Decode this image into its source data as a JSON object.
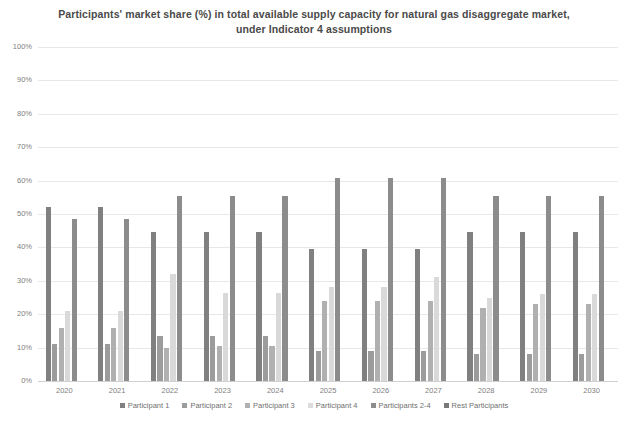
{
  "chart_data": {
    "type": "bar",
    "title": "Participants' market share (%) in total available supply capacity for natural gas disaggregate market, under Indicator 4 assumptions",
    "title_line1": "Participants' market share (%) in total available supply capacity for natural gas disaggregate market,",
    "title_line2": "under Indicator 4 assumptions",
    "xlabel": "",
    "ylabel": "",
    "ylim": [
      0,
      100
    ],
    "ytick_labels": [
      "100%",
      "90%",
      "80%",
      "70%",
      "60%",
      "50%",
      "40%",
      "30%",
      "20%",
      "10%",
      "0%"
    ],
    "ytick_values": [
      100,
      90,
      80,
      70,
      60,
      50,
      40,
      30,
      20,
      10,
      0
    ],
    "grid": true,
    "legend_position": "bottom",
    "categories": [
      "2020",
      "2021",
      "2022",
      "2023",
      "2024",
      "2025",
      "2026",
      "2027",
      "2028",
      "2029",
      "2030"
    ],
    "series": [
      {
        "name": "Participant 1",
        "color": "#808080",
        "values": [
          52,
          52,
          44.5,
          44.5,
          44.5,
          39.5,
          39.5,
          39.5,
          44.5,
          44.5,
          44.5
        ]
      },
      {
        "name": "Participant 2",
        "color": "#9c9c9c",
        "values": [
          11,
          11,
          13.5,
          13.5,
          13.5,
          9,
          9,
          9,
          8,
          8,
          8
        ]
      },
      {
        "name": "Participant 3",
        "color": "#b0b0b0",
        "values": [
          16,
          16,
          10,
          10.5,
          10.5,
          24,
          24,
          24,
          22,
          23,
          23
        ]
      },
      {
        "name": "Participant 4",
        "color": "#d9d9d9",
        "values": [
          21,
          21,
          32,
          26.5,
          26.5,
          28,
          28,
          31,
          25,
          26,
          26
        ]
      },
      {
        "name": "Participants 2-4",
        "color": "#8c8c8c",
        "values": [
          48.5,
          48.5,
          55.5,
          55.5,
          55.5,
          60.8,
          60.8,
          60.8,
          55.5,
          55.5,
          55.5
        ]
      },
      {
        "name": "Rest Participants",
        "color": "#787878",
        "values": [
          0,
          0,
          0,
          0,
          0,
          0,
          0,
          0,
          0,
          0,
          0
        ]
      }
    ]
  },
  "legend": {
    "items": [
      {
        "label": "Participant 1",
        "color": "#808080"
      },
      {
        "label": "Participant 2",
        "color": "#9c9c9c"
      },
      {
        "label": "Participant 3",
        "color": "#b0b0b0"
      },
      {
        "label": "Participant 4",
        "color": "#dcdcdc"
      },
      {
        "label": "Participants 2-4",
        "color": "#8c8c8c"
      },
      {
        "label": "Rest Participants",
        "color": "#787878"
      }
    ]
  }
}
